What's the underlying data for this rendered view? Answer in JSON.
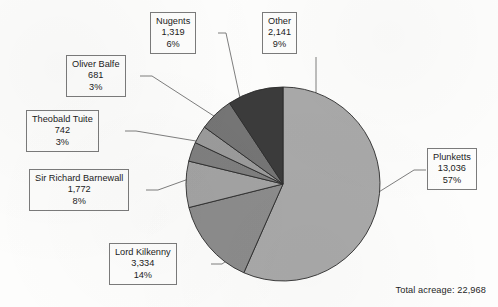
{
  "chart_data": {
    "type": "pie",
    "title": "",
    "subtitle": "",
    "xlabel": "",
    "ylabel": "",
    "legend_position": "callout-labels",
    "grid": false,
    "unit": "acres",
    "total_label": "Total acreage: 22,968",
    "total_value": 22968,
    "categories": [
      "Plunketts",
      "Lord Kilkenny",
      "Sir Richard Barnewall",
      "Theobald Tuite",
      "Oliver Balfe",
      "Nugents",
      "Other"
    ],
    "values": [
      13036,
      3334,
      1772,
      742,
      681,
      1319,
      2141
    ],
    "percents": [
      57,
      14,
      8,
      3,
      3,
      6,
      9
    ],
    "value_labels": [
      "13,036",
      "3,334",
      "1,772",
      "742",
      "681",
      "1,319",
      "2,141"
    ],
    "percent_labels": [
      "57%",
      "14%",
      "8%",
      "3%",
      "3%",
      "6%",
      "9%"
    ],
    "colors": [
      "#a9a9a9",
      "#8c8c8c",
      "#a3a3a3",
      "#7f7f7f",
      "#9b9b9b",
      "#757575",
      "#3b3b3b"
    ],
    "slice_border_color": "#2b2b2b",
    "start_angle_deg": 0,
    "direction": "clockwise"
  },
  "slices": [
    {
      "key": "plunketts",
      "name": "Plunketts",
      "value": "13,036",
      "percent": "57%",
      "color": "#a9a9a9"
    },
    {
      "key": "lord-kilkenny",
      "name": "Lord Kilkenny",
      "value": "3,334",
      "percent": "14%",
      "color": "#8c8c8c"
    },
    {
      "key": "sir-richard-barnewall",
      "name": "Sir Richard Barnewall",
      "value": "1,772",
      "percent": "8%",
      "color": "#a3a3a3"
    },
    {
      "key": "theobald-tuite",
      "name": "Theobald Tuite",
      "value": "742",
      "percent": "3%",
      "color": "#7f7f7f"
    },
    {
      "key": "oliver-balfe",
      "name": "Oliver Balfe",
      "value": "681",
      "percent": "3%",
      "color": "#9b9b9b"
    },
    {
      "key": "nugents",
      "name": "Nugents",
      "value": "1,319",
      "percent": "6%",
      "color": "#757575"
    },
    {
      "key": "other",
      "name": "Other",
      "value": "2,141",
      "percent": "9%",
      "color": "#3b3b3b"
    }
  ],
  "footer": {
    "total_acreage": "Total acreage: 22,968"
  }
}
